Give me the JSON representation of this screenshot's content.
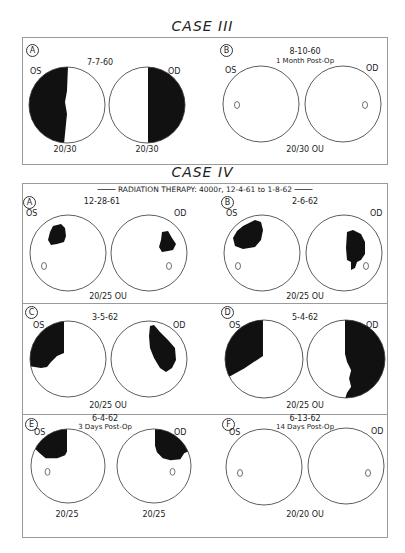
{
  "figure": {
    "cases": [
      {
        "title": "CASE III",
        "panels": [
          {
            "letter": "A",
            "date": "7-7-60",
            "note": "",
            "left_eye": {
              "label": "OS",
              "acuity": "20/30",
              "defect": "Dense temporal hemianopic field loss (left half of left-eye field)",
              "blind_spot_shown": false
            },
            "right_eye": {
              "label": "OD",
              "acuity": "20/30",
              "defect": "Dense temporal hemianopic field loss (right half of right-eye field)",
              "blind_spot_shown": false
            },
            "combined_acuity": ""
          },
          {
            "letter": "B",
            "date": "8-10-60",
            "note": "1 Month Post-Op",
            "left_eye": {
              "label": "OS",
              "acuity": "",
              "defect": "None (full field)",
              "blind_spot_shown": true
            },
            "right_eye": {
              "label": "OD",
              "acuity": "",
              "defect": "None (full field)",
              "blind_spot_shown": true
            },
            "combined_acuity": "20/30 OU"
          }
        ]
      },
      {
        "title": "CASE IV",
        "header_note": "RADIATION THERAPY: 4000r, 12-4-61 to 1-8-62",
        "panels": [
          {
            "letter": "A",
            "date": "12-28-61",
            "note": "",
            "left_eye": {
              "label": "OS",
              "acuity": "",
              "defect": "Small upper temporal scotoma",
              "blind_spot_shown": true
            },
            "right_eye": {
              "label": "OD",
              "acuity": "",
              "defect": "Small upper temporal scotoma",
              "blind_spot_shown": true
            },
            "combined_acuity": "20/25 OU"
          },
          {
            "letter": "B",
            "date": "2-6-62",
            "note": "",
            "left_eye": {
              "label": "OS",
              "acuity": "",
              "defect": "Enlarged upper temporal scotoma",
              "blind_spot_shown": true
            },
            "right_eye": {
              "label": "OD",
              "acuity": "",
              "defect": "Enlarged temporal scotoma",
              "blind_spot_shown": true
            },
            "combined_acuity": "20/25 OU"
          },
          {
            "letter": "C",
            "date": "3-5-62",
            "note": "",
            "left_eye": {
              "label": "OS",
              "acuity": "",
              "defect": "Upper temporal quadrant defect",
              "blind_spot_shown": false
            },
            "right_eye": {
              "label": "OD",
              "acuity": "",
              "defect": "Temporal defect",
              "blind_spot_shown": false
            },
            "combined_acuity": "20/25 OU"
          },
          {
            "letter": "D",
            "date": "5-4-62",
            "note": "",
            "left_eye": {
              "label": "OS",
              "acuity": "",
              "defect": "Extensive temporal field loss",
              "blind_spot_shown": false
            },
            "right_eye": {
              "label": "OD",
              "acuity": "",
              "defect": "Near-complete temporal hemianopia",
              "blind_spot_shown": false
            },
            "combined_acuity": "20/25 OU"
          },
          {
            "letter": "E",
            "date": "6-4-62",
            "note": "3 Days Post-Op",
            "left_eye": {
              "label": "OS",
              "acuity": "20/25",
              "defect": "Residual upper temporal defect",
              "blind_spot_shown": true
            },
            "right_eye": {
              "label": "OD",
              "acuity": "20/25",
              "defect": "Residual upper temporal defect",
              "blind_spot_shown": true
            },
            "combined_acuity": ""
          },
          {
            "letter": "F",
            "date": "6-13-62",
            "note": "14 Days Post-Op",
            "left_eye": {
              "label": "OS",
              "acuity": "",
              "defect": "None (full field)",
              "blind_spot_shown": true
            },
            "right_eye": {
              "label": "OD",
              "acuity": "",
              "defect": "None (full field)",
              "blind_spot_shown": true
            },
            "combined_acuity": "20/20 OU"
          }
        ]
      }
    ]
  },
  "colors": {
    "ink": "#111111",
    "border": "#9a9a9a",
    "paper": "#ffffff"
  }
}
